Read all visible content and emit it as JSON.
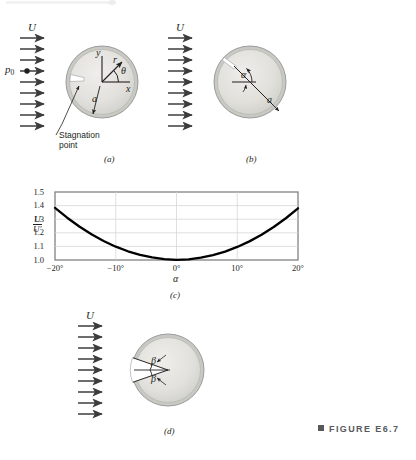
{
  "figure": {
    "caption": "FIGURE E6.7",
    "caption_marker": "square-bullet"
  },
  "panels": [
    {
      "id": "a",
      "label": "(a)",
      "freestream_label": "U",
      "pressure_label": "p",
      "pressure_sub": "0",
      "annotations": {
        "y_axis": "y",
        "x_axis": "x",
        "radius_vector": "r",
        "angle": "θ",
        "radius": "a",
        "stagnation_line1": "Stagnation",
        "stagnation_line2": "point"
      },
      "arrow_count": 9
    },
    {
      "id": "b",
      "label": "(b)",
      "freestream_label": "U",
      "annotations": {
        "angle": "α",
        "radius": "a"
      },
      "arrow_count": 9
    },
    {
      "id": "c",
      "label": "(c)"
    },
    {
      "id": "d",
      "label": "(d)",
      "freestream_label": "U",
      "annotations": {
        "angle_upper": "β",
        "angle_lower": "β"
      },
      "arrow_count": 9
    }
  ],
  "chart_data": {
    "type": "line",
    "title": "",
    "xlabel": "α",
    "ylabel": "U/U'",
    "ylabel_numerator": "U",
    "ylabel_denominator": "U'",
    "xlim": [
      -20,
      20
    ],
    "ylim": [
      1.0,
      1.5
    ],
    "xticks": [
      -20,
      -10,
      0,
      10,
      20
    ],
    "xticklabels": [
      "−20°",
      "−10°",
      "0°",
      "10°",
      "20°"
    ],
    "yticks": [
      1.0,
      1.1,
      1.2,
      1.3,
      1.4,
      1.5
    ],
    "yticklabels": [
      "1.0",
      "1.1",
      "1.2",
      "1.3",
      "1.4",
      "1.5"
    ],
    "grid": "horizontal",
    "legend": "none",
    "series": [
      {
        "name": "U/U'",
        "x": [
          -20,
          -18,
          -16,
          -14,
          -12,
          -10,
          -8,
          -6,
          -4,
          -2,
          0,
          2,
          4,
          6,
          8,
          10,
          12,
          14,
          16,
          18,
          20
        ],
        "y": [
          1.383,
          1.311,
          1.246,
          1.189,
          1.14,
          1.098,
          1.064,
          1.038,
          1.019,
          1.006,
          1.001,
          1.005,
          1.017,
          1.036,
          1.062,
          1.096,
          1.137,
          1.186,
          1.243,
          1.307,
          1.38
        ]
      }
    ]
  },
  "colors": {
    "disk_fill": "#d9d9d6",
    "disk_inner": "#e4e3df",
    "disk_edge": "#8f9091",
    "arrow": "#3c3c3c",
    "curve": "#000000",
    "axis": "#808285",
    "grid": "#d6d7d8",
    "caption": "#58595b"
  }
}
